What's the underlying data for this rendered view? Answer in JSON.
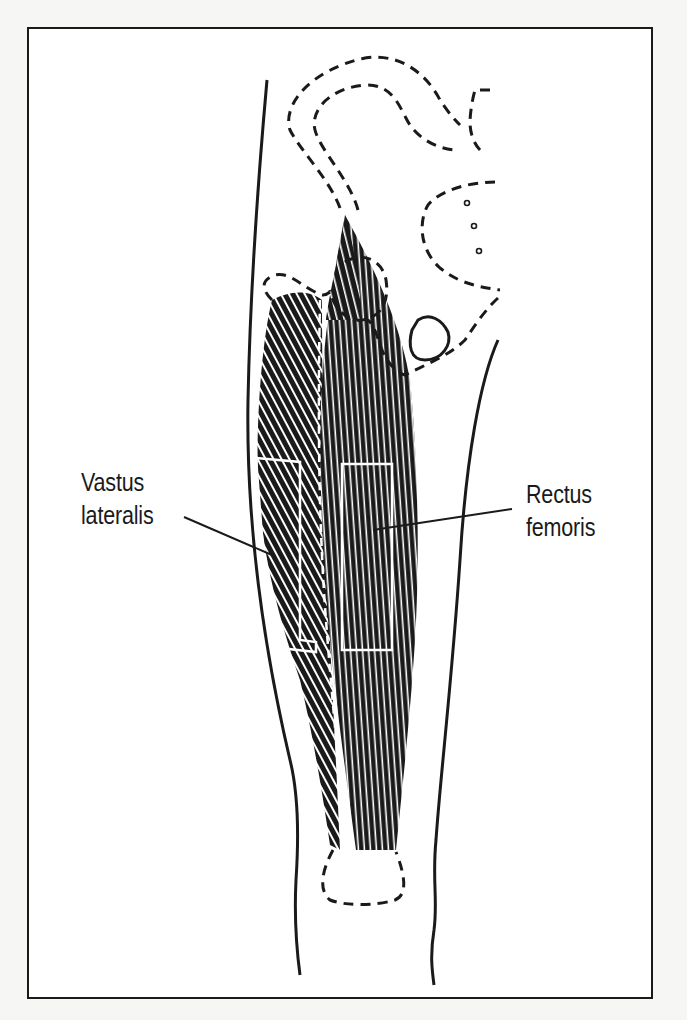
{
  "figure": {
    "labels": {
      "vastus_lateralis": {
        "line1": "Vastus",
        "line2": "lateralis"
      },
      "rectus_femoris": {
        "line1": "Rectus",
        "line2": "femoris"
      }
    },
    "colors": {
      "ink": "#1a1a1a",
      "paper": "#ffffff",
      "background": "#f6f6f4"
    }
  }
}
